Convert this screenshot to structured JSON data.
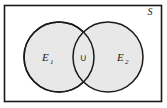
{
  "figure": {
    "type": "venn-diagram",
    "universe": {
      "label": "S",
      "shape": "rectangle",
      "fill": "#ffffff",
      "stroke": "#1a1a1a",
      "label_position": "top-right-inside"
    },
    "sets": [
      {
        "id": "E1",
        "label": "E",
        "subscript": "1",
        "shape": "circle",
        "fill": "#e8e8e8",
        "stroke": "#1a1a1a",
        "cx": 59,
        "cy": 57,
        "r": 35
      },
      {
        "id": "E2",
        "label": "E",
        "subscript": "2",
        "shape": "circle",
        "fill": "#e8e8e8",
        "stroke": "#1a1a1a",
        "cx": 108,
        "cy": 57,
        "r": 35
      }
    ],
    "intersection": {
      "symbol": "∪",
      "name": "union-symbol",
      "fill": "#e8e8e8"
    },
    "colors": {
      "set_fill": "#e8e8e8",
      "outline": "#1a1a1a",
      "background": "#ffffff",
      "text": "#1a1a1a"
    }
  }
}
